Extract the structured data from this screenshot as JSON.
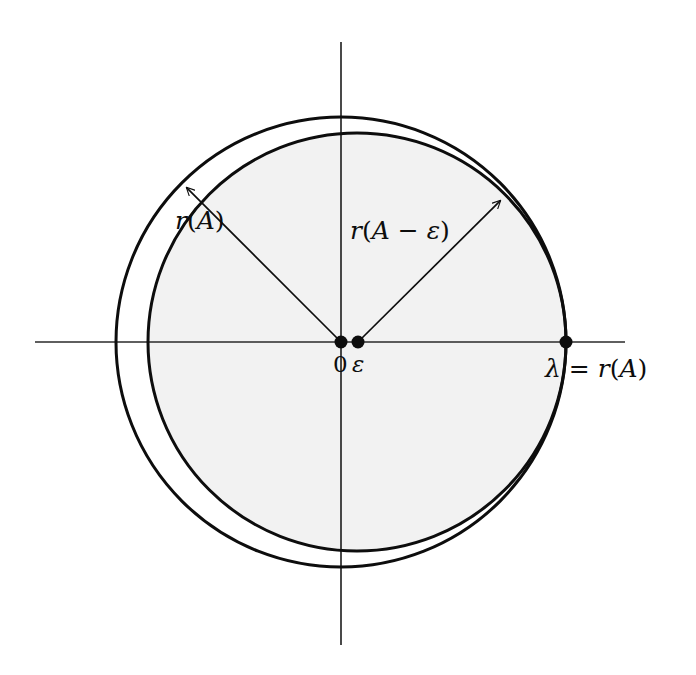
{
  "figure": {
    "background_color": "#ffffff",
    "ink_color": "#0d0d0d",
    "disk_fill_color": "#f2f2f2",
    "annulus_fill_color": "#ffffff"
  },
  "axes": {
    "horizontal": {
      "name": "real-axis",
      "x_start": 35,
      "x_end": 625,
      "y": 342
    },
    "vertical": {
      "name": "imaginary-axis",
      "x": 341,
      "y_start": 42,
      "y_end": 645
    },
    "stroke_width": 1.6
  },
  "circles": {
    "outer": {
      "label": "r(A)",
      "center_x": 341,
      "center_y": 342,
      "radius": 225,
      "stroke_width": 3.0,
      "filled": false
    },
    "inner": {
      "label": "r(A - ε)",
      "center_x": 357,
      "center_y": 342,
      "radius": 209,
      "stroke_width": 3.0,
      "filled": true
    }
  },
  "points": [
    {
      "name": "origin",
      "label": "0",
      "x": 341,
      "y": 342,
      "radius": 6.5
    },
    {
      "name": "epsilon",
      "label": "ε",
      "x": 358,
      "y": 342,
      "radius": 6.5
    },
    {
      "name": "lambda",
      "label": "λ = r(A)",
      "x": 566,
      "y": 342,
      "radius": 6.5
    }
  ],
  "arrows": [
    {
      "name": "radius-arrow-outer",
      "label": "r(A)",
      "from_x": 341,
      "from_y": 342,
      "to_x": 182,
      "to_y": 183,
      "angle_deg": 135
    },
    {
      "name": "radius-arrow-inner",
      "label": "r(A - ε)",
      "from_x": 358,
      "from_y": 342,
      "to_x": 505,
      "to_y": 196,
      "angle_deg": 45
    }
  ],
  "labels": {
    "radius_outer": {
      "text_r": "r",
      "text_open": "(",
      "text_A": "A",
      "text_close": ")",
      "full": "r(A)"
    },
    "radius_inner": {
      "text_r": "r",
      "text_open": "(",
      "text_A": "A",
      "text_minus": " − ",
      "text_eps": "ε",
      "text_close": ")",
      "full": "r(A − ε)"
    },
    "origin": "0",
    "epsilon": "ε",
    "lambda": {
      "text_lambda": "λ",
      "text_equals": " = ",
      "text_r": "r",
      "text_open": "(",
      "text_A": "A",
      "text_close": ")",
      "full": "λ = r(A)"
    }
  }
}
